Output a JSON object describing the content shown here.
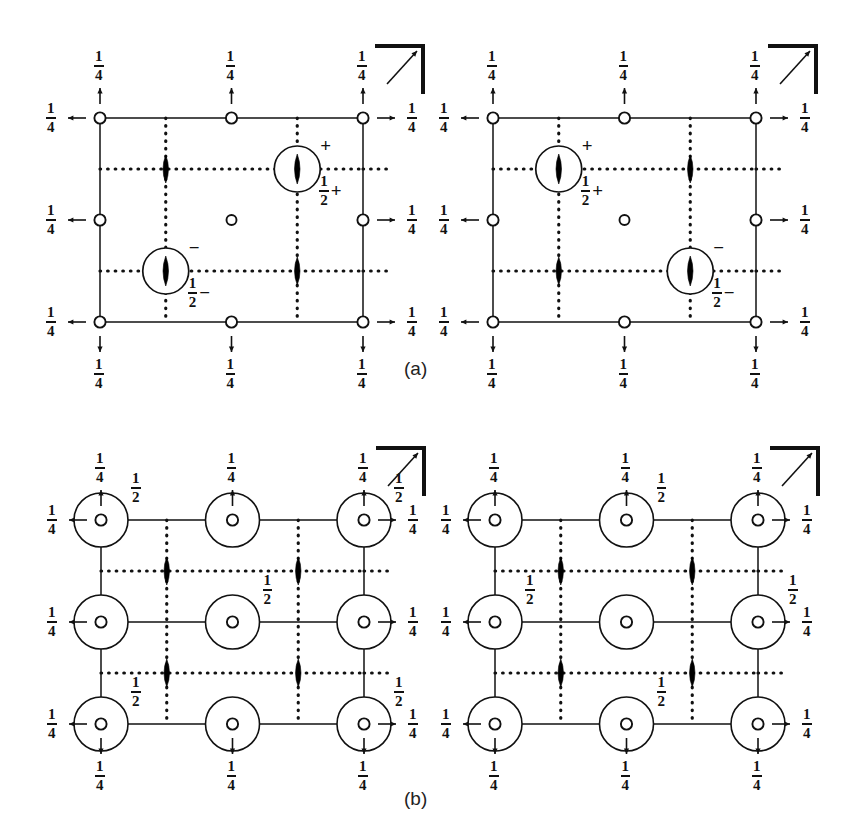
{
  "figure": {
    "panels": [
      {
        "id": "a",
        "label": "(a)",
        "label_x": 404,
        "label_y": 358
      },
      {
        "id": "b",
        "label": "(b)",
        "label_x": 404,
        "label_y": 788
      }
    ],
    "quarter": "1/4",
    "half": "1/2",
    "plus": "+",
    "minus": "−",
    "fraction_numerator_quarter": "1",
    "fraction_denominator_quarter": "4",
    "fraction_numerator_half": "1",
    "fraction_denominator_half": "2",
    "colors": {
      "ink": "#111111",
      "background": "#ffffff",
      "symbol_fill": "#000000"
    },
    "symbols": {
      "open_circle": "open-circle",
      "large_open_circle": "large-open-circle",
      "lens_two_fold": "two-fold-rotation-lens",
      "circled_lens": "circled-two-fold-lens",
      "arrow": "arrow",
      "axis_marker": "axis-orientation-marker",
      "dotted_line": "mirror-plane-dotted",
      "solid_line": "unit-cell-edge"
    },
    "diagrams": [
      {
        "id": "a-left",
        "panel": "a",
        "x": 100,
        "y": 118,
        "w": 263,
        "h": 204,
        "edge_labels": {
          "top": [
            "1/4",
            "1/4",
            "1/4"
          ],
          "bottom": [
            "1/4",
            "1/4",
            "1/4"
          ],
          "left": [
            "1/4",
            "1/4",
            "1/4"
          ],
          "right": [
            "1/4",
            "1/4",
            "1/4"
          ]
        },
        "circled_lens_sites": [
          {
            "fx": 0.75,
            "fy": 0.25,
            "sign": "+",
            "height": "1/2",
            "height_sign": "+"
          },
          {
            "fx": 0.25,
            "fy": 0.75,
            "sign": "−",
            "height": "1/2",
            "height_sign": "−"
          }
        ],
        "plain_lens_sites": [
          {
            "fx": 0.25,
            "fy": 0.25
          },
          {
            "fx": 0.75,
            "fy": 0.75
          }
        ],
        "center_circle": {
          "fx": 0.5,
          "fy": 0.5
        },
        "axis_marker": true
      },
      {
        "id": "a-right",
        "panel": "a",
        "x": 493,
        "y": 118,
        "w": 263,
        "h": 204,
        "edge_labels": {
          "top": [
            "1/4",
            "1/4",
            "1/4"
          ],
          "bottom": [
            "1/4",
            "1/4",
            "1/4"
          ],
          "left": [
            "1/4",
            "1/4",
            "1/4"
          ],
          "right": [
            "1/4",
            "1/4",
            "1/4"
          ]
        },
        "circled_lens_sites": [
          {
            "fx": 0.25,
            "fy": 0.25,
            "sign": "+",
            "height": "1/2",
            "height_sign": "+"
          },
          {
            "fx": 0.75,
            "fy": 0.75,
            "sign": "−",
            "height": "1/2",
            "height_sign": "−"
          }
        ],
        "plain_lens_sites": [
          {
            "fx": 0.75,
            "fy": 0.25
          },
          {
            "fx": 0.25,
            "fy": 0.75
          }
        ],
        "center_circle": {
          "fx": 0.5,
          "fy": 0.5
        },
        "axis_marker": true
      },
      {
        "id": "b-left",
        "panel": "b",
        "x": 101,
        "y": 520,
        "w": 263,
        "h": 204,
        "edge_labels": {
          "top": [
            "1/4",
            "1/4",
            "1/4"
          ],
          "bottom": [
            "1/4",
            "1/4",
            "1/4"
          ],
          "left": [
            "1/4",
            "1/4",
            "1/4"
          ],
          "right": [
            "1/4",
            "1/4",
            "1/4"
          ]
        },
        "big_circle_sites": [
          {
            "fx": 0,
            "fy": 0,
            "half": "1/2",
            "half_pos": "tr"
          },
          {
            "fx": 0.5,
            "fy": 0,
            "half": null,
            "half_pos": null
          },
          {
            "fx": 1,
            "fy": 0,
            "half": "1/2",
            "half_pos": "tr"
          },
          {
            "fx": 0,
            "fy": 0.5,
            "half": null,
            "half_pos": null
          },
          {
            "fx": 0.5,
            "fy": 0.5,
            "half": "1/2",
            "half_pos": "tr"
          },
          {
            "fx": 1,
            "fy": 0.5,
            "half": null,
            "half_pos": null
          },
          {
            "fx": 0,
            "fy": 1,
            "half": "1/2",
            "half_pos": "tr"
          },
          {
            "fx": 0.5,
            "fy": 1,
            "half": null,
            "half_pos": null
          },
          {
            "fx": 1,
            "fy": 1,
            "half": "1/2",
            "half_pos": "tr"
          }
        ],
        "plain_lens_sites": [
          {
            "fx": 0.25,
            "fy": 0.25
          },
          {
            "fx": 0.75,
            "fy": 0.25
          },
          {
            "fx": 0.25,
            "fy": 0.75
          },
          {
            "fx": 0.75,
            "fy": 0.75
          }
        ],
        "axis_marker": true
      },
      {
        "id": "b-right",
        "panel": "b",
        "x": 495,
        "y": 520,
        "w": 263,
        "h": 204,
        "edge_labels": {
          "top": [
            "1/4",
            "1/4",
            "1/4"
          ],
          "bottom": [
            "1/4",
            "1/4",
            "1/4"
          ],
          "left": [
            "1/4",
            "1/4",
            "1/4"
          ],
          "right": [
            "1/4",
            "1/4",
            "1/4"
          ]
        },
        "big_circle_sites": [
          {
            "fx": 0,
            "fy": 0,
            "half": null,
            "half_pos": null
          },
          {
            "fx": 0.5,
            "fy": 0,
            "half": "1/2",
            "half_pos": "tr"
          },
          {
            "fx": 1,
            "fy": 0,
            "half": null,
            "half_pos": null
          },
          {
            "fx": 0,
            "fy": 0.5,
            "half": "1/2",
            "half_pos": "tr"
          },
          {
            "fx": 0.5,
            "fy": 0.5,
            "half": null,
            "half_pos": null
          },
          {
            "fx": 1,
            "fy": 0.5,
            "half": "1/2",
            "half_pos": "tr"
          },
          {
            "fx": 0,
            "fy": 1,
            "half": null,
            "half_pos": null
          },
          {
            "fx": 0.5,
            "fy": 1,
            "half": "1/2",
            "half_pos": "tr"
          },
          {
            "fx": 1,
            "fy": 1,
            "half": null,
            "half_pos": null
          }
        ],
        "plain_lens_sites": [
          {
            "fx": 0.25,
            "fy": 0.25
          },
          {
            "fx": 0.75,
            "fy": 0.25
          },
          {
            "fx": 0.25,
            "fy": 0.75
          },
          {
            "fx": 0.75,
            "fy": 0.75
          }
        ],
        "axis_marker": true
      }
    ]
  }
}
